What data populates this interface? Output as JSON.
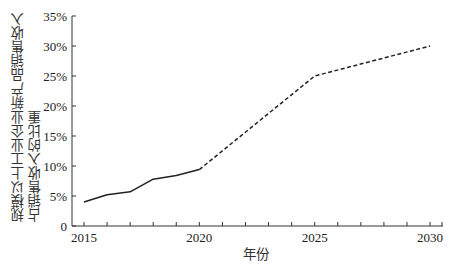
{
  "chart_data": {
    "type": "line",
    "title": "",
    "xlabel": "年份",
    "ylabel": "规模以上工业企业新产品销售收入占销售收入的比重",
    "ylabel_lines": [
      "规模以上工业企业新产品销售收入",
      "占销售收入的比重"
    ],
    "x": [
      2015,
      2016,
      2017,
      2018,
      2019,
      2020,
      2025,
      2030
    ],
    "series": [
      {
        "name": "actual",
        "style": "solid",
        "x": [
          2015,
          2016,
          2017,
          2018,
          2019,
          2020
        ],
        "values": [
          4.0,
          5.2,
          5.7,
          7.8,
          8.4,
          9.4
        ]
      },
      {
        "name": "projected",
        "style": "dashed",
        "x": [
          2020,
          2025,
          2030
        ],
        "values": [
          9.4,
          25.0,
          30.0
        ]
      }
    ],
    "xticks": [
      "2015",
      "2020",
      "2025",
      "2030"
    ],
    "yticks": [
      "0",
      "5%",
      "10%",
      "15%",
      "20%",
      "25%",
      "30%",
      "35%"
    ],
    "ylim": [
      0,
      35
    ],
    "xlim": [
      2014.5,
      2030.5
    ],
    "grid": false,
    "legend": null
  }
}
